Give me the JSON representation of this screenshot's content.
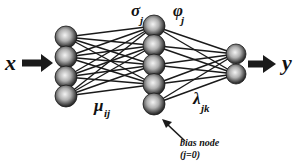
{
  "diagram": {
    "type": "neural-network",
    "input_label": "x",
    "output_label": "y",
    "layers": [
      {
        "name": "input",
        "x": 66,
        "radius": 11,
        "nodes_y": [
          37,
          57,
          77,
          96
        ]
      },
      {
        "name": "hidden",
        "x": 154,
        "radius": 11,
        "nodes_y": [
          26,
          45.5,
          65,
          84.5,
          104
        ],
        "bias_index": 4
      },
      {
        "name": "output",
        "x": 236,
        "radius": 10,
        "nodes_y": [
          54,
          74
        ]
      }
    ],
    "labels": {
      "sigma": {
        "main": "σ",
        "sub": "j"
      },
      "phi": {
        "main": "φ",
        "sub": "j"
      },
      "mu": {
        "main": "μ",
        "sub": "ij"
      },
      "lambda": {
        "main": "λ",
        "sub": "jk"
      },
      "bias_line1": "bias node",
      "bias_line2": "(j=0)"
    },
    "colors": {
      "line": "#1a1a1a",
      "node_light": "#f2f2f2",
      "node_dark": "#2a2a2a"
    }
  }
}
